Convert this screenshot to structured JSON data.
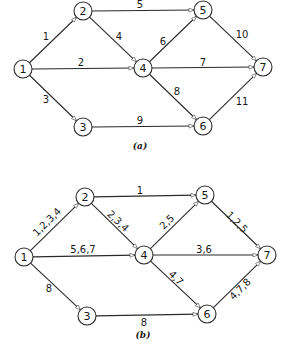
{
  "diagrams": [
    {
      "caption": "(a)",
      "caption_pos": [
        140,
        146
      ],
      "node_radius": 9,
      "nodes": [
        {
          "id": "1",
          "x": 23,
          "y": 69
        },
        {
          "id": "2",
          "x": 83,
          "y": 11
        },
        {
          "id": "3",
          "x": 83,
          "y": 127
        },
        {
          "id": "4",
          "x": 143,
          "y": 68
        },
        {
          "id": "5",
          "x": 203,
          "y": 10
        },
        {
          "id": "6",
          "x": 203,
          "y": 126
        },
        {
          "id": "7",
          "x": 263,
          "y": 67
        }
      ],
      "edges": [
        {
          "from": "1",
          "to": "2",
          "label": "1",
          "lx": 46,
          "ly": 36,
          "rot": 0
        },
        {
          "from": "1",
          "to": "4",
          "label": "2",
          "lx": 81,
          "ly": 62,
          "rot": 0
        },
        {
          "from": "1",
          "to": "3",
          "label": "3",
          "lx": 46,
          "ly": 99,
          "rot": 0
        },
        {
          "from": "2",
          "to": "4",
          "label": "4",
          "lx": 119,
          "ly": 36,
          "rot": 0
        },
        {
          "from": "2",
          "to": "5",
          "label": "5",
          "lx": 140,
          "ly": 4,
          "rot": 0
        },
        {
          "from": "4",
          "to": "5",
          "label": "6",
          "lx": 163,
          "ly": 41,
          "rot": 0
        },
        {
          "from": "4",
          "to": "7",
          "label": "7",
          "lx": 203,
          "ly": 62,
          "rot": 0
        },
        {
          "from": "4",
          "to": "6",
          "label": "8",
          "lx": 177,
          "ly": 91,
          "rot": 0
        },
        {
          "from": "3",
          "to": "6",
          "label": "9",
          "lx": 140,
          "ly": 120,
          "rot": 0
        },
        {
          "from": "5",
          "to": "7",
          "label": "10",
          "lx": 242,
          "ly": 34,
          "rot": 0
        },
        {
          "from": "6",
          "to": "7",
          "label": "11",
          "lx": 242,
          "ly": 101,
          "rot": 0
        }
      ]
    },
    {
      "caption": "(b)",
      "caption_pos": [
        143,
        335
      ],
      "node_radius": 9,
      "nodes": [
        {
          "id": "1",
          "x": 24,
          "y": 257
        },
        {
          "id": "2",
          "x": 85,
          "y": 197
        },
        {
          "id": "3",
          "x": 87,
          "y": 316
        },
        {
          "id": "4",
          "x": 144,
          "y": 255
        },
        {
          "id": "5",
          "x": 205,
          "y": 195
        },
        {
          "id": "6",
          "x": 207,
          "y": 314
        },
        {
          "id": "7",
          "x": 267,
          "y": 255
        }
      ],
      "edges": [
        {
          "from": "1",
          "to": "2",
          "label": "1,2,3,4",
          "lx": 47,
          "ly": 222,
          "rot": -45
        },
        {
          "from": "1",
          "to": "4",
          "label": "5,6,7",
          "lx": 83,
          "ly": 249,
          "rot": 0
        },
        {
          "from": "1",
          "to": "3",
          "label": "8",
          "lx": 49,
          "ly": 288,
          "rot": 0
        },
        {
          "from": "2",
          "to": "4",
          "label": "2,3,4",
          "lx": 118,
          "ly": 221,
          "rot": 44
        },
        {
          "from": "2",
          "to": "5",
          "label": "1",
          "lx": 140,
          "ly": 190,
          "rot": 0
        },
        {
          "from": "4",
          "to": "5",
          "label": "2,5",
          "lx": 167,
          "ly": 222,
          "rot": -45
        },
        {
          "from": "4",
          "to": "7",
          "label": "3,6",
          "lx": 204,
          "ly": 249,
          "rot": 0
        },
        {
          "from": "4",
          "to": "6",
          "label": "4,7",
          "lx": 176,
          "ly": 278,
          "rot": 45
        },
        {
          "from": "3",
          "to": "6",
          "label": "8",
          "lx": 144,
          "ly": 322,
          "rot": 0
        },
        {
          "from": "5",
          "to": "7",
          "label": "1,2,5",
          "lx": 237,
          "ly": 222,
          "rot": 45
        },
        {
          "from": "6",
          "to": "7",
          "label": "4,7,8",
          "lx": 240,
          "ly": 289,
          "rot": -45
        }
      ]
    }
  ]
}
